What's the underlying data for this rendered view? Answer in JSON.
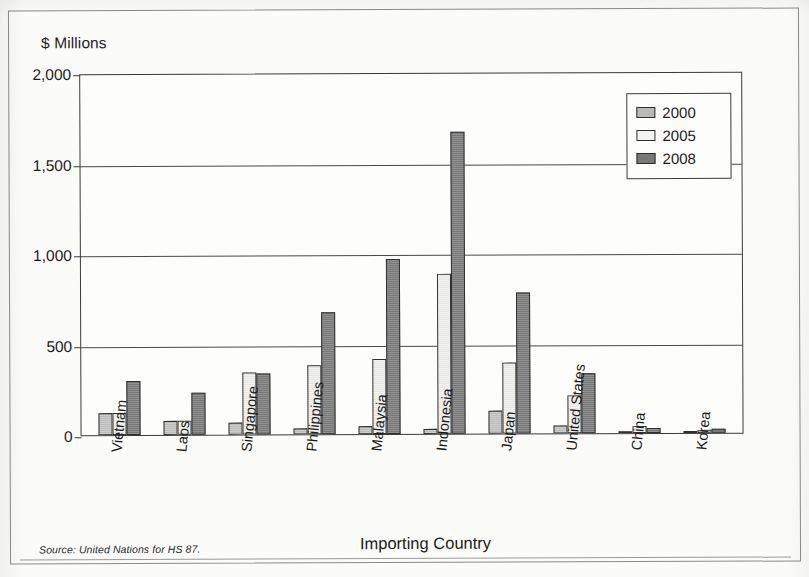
{
  "figure": {
    "y_axis_unit_label": "$ Millions",
    "x_axis_title": "Importing Country",
    "source_note": "Source: United Nations for HS 87."
  },
  "legend": {
    "entries": [
      {
        "label": "2000",
        "swatch": "medium-gray",
        "color": "#b9b9b9"
      },
      {
        "label": "2005",
        "swatch": "white",
        "color": "#f4f4f1"
      },
      {
        "label": "2008",
        "swatch": "dark-gray",
        "color": "#787878"
      }
    ]
  },
  "chart_data": {
    "type": "bar",
    "title": "",
    "xlabel": "Importing Country",
    "ylabel": "$ Millions",
    "ylim": [
      0,
      2000
    ],
    "yticks": [
      "0",
      "500",
      "1,000",
      "1,500",
      "2,000"
    ],
    "ytick_values": [
      0,
      500,
      1000,
      1500,
      2000
    ],
    "grid": true,
    "legend_position": "top-right",
    "categories": [
      "Vietnam",
      "Laos",
      "Singapore",
      "Philippines",
      "Malaysia",
      "Indonesia",
      "Japan",
      "United States",
      "China",
      "Korea"
    ],
    "series": [
      {
        "name": "2000",
        "color": "#c3c3c3",
        "values": [
          120,
          80,
          65,
          35,
          45,
          25,
          125,
          45,
          5,
          10
        ]
      },
      {
        "name": "2005",
        "color": "#efefec",
        "values": [
          120,
          80,
          340,
          380,
          415,
          885,
          390,
          210,
          40,
          15
        ]
      },
      {
        "name": "2008",
        "color": "#7c7c7c",
        "values": [
          300,
          230,
          335,
          675,
          965,
          1670,
          780,
          330,
          30,
          20
        ]
      }
    ]
  }
}
